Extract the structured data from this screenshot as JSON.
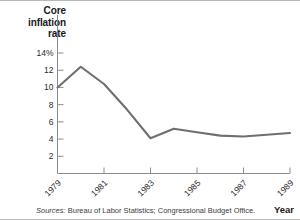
{
  "chart_data": {
    "type": "line",
    "title": "Core inflation rate",
    "title_lines": [
      "Core",
      "inflation",
      "rate"
    ],
    "xlabel": "Year",
    "ylabel": "Core inflation rate",
    "ylim": [
      0,
      14
    ],
    "xlim": [
      1979,
      1989
    ],
    "grid": false,
    "legend": null,
    "ytick_labels": [
      "14%",
      "12",
      "10",
      "8",
      "6",
      "4",
      "2"
    ],
    "ytick_values": [
      14,
      12,
      10,
      8,
      6,
      4,
      2
    ],
    "xtick_labels": [
      "1979",
      "1981",
      "1983",
      "1985",
      "1987",
      "1989"
    ],
    "xtick_values": [
      1979,
      1981,
      1983,
      1985,
      1987,
      1989
    ],
    "x": [
      1979,
      1980,
      1981,
      1982,
      1983,
      1984,
      1985,
      1986,
      1987,
      1988,
      1989
    ],
    "values": [
      10.0,
      12.4,
      10.4,
      7.4,
      4.1,
      5.2,
      4.8,
      4.4,
      4.3,
      4.5,
      4.7
    ],
    "series": [
      {
        "name": "Core inflation rate",
        "color": "#6f6f6f",
        "values": [
          10.0,
          12.4,
          10.4,
          7.4,
          4.1,
          5.2,
          4.8,
          4.4,
          4.3,
          4.5,
          4.7
        ]
      }
    ],
    "source_prefix": "Sources:",
    "source_text": "Bureau of Labor Statistics; Congressional Budget Office.",
    "colors": {
      "line": "#6f6f6f",
      "axis": "#8c8c8c",
      "text": "#231f20",
      "frame": "#b9b9b9",
      "background": "#ffffff"
    }
  }
}
